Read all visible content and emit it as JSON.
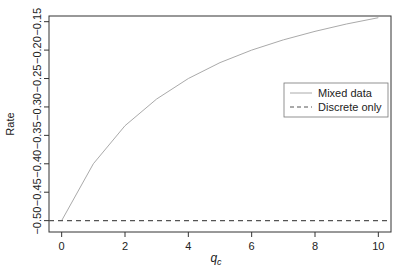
{
  "chart_data": {
    "type": "line",
    "title": "",
    "xlabel": "q_c",
    "xlabel_main": "q",
    "xlabel_sub": "c",
    "ylabel": "Rate",
    "xlim": [
      -0.4,
      10.4
    ],
    "ylim": [
      -0.52,
      -0.14
    ],
    "xticks": [
      0,
      2,
      4,
      6,
      8,
      10
    ],
    "xtick_labels": [
      "0",
      "2",
      "4",
      "6",
      "8",
      "10"
    ],
    "yticks": [
      -0.5,
      -0.45,
      -0.4,
      -0.35,
      -0.3,
      -0.25,
      -0.2,
      -0.15
    ],
    "ytick_labels": [
      "−0.50",
      "−0.45",
      "−0.40",
      "−0.35",
      "−0.30",
      "−0.25",
      "−0.20",
      "−0.15"
    ],
    "grid": false,
    "legend_position": "right-middle",
    "x": [
      0,
      1,
      2,
      3,
      4,
      5,
      6,
      7,
      8,
      9,
      10
    ],
    "series": [
      {
        "name": "Mixed data",
        "style": "solid",
        "color": "#aaaaaa",
        "values": [
          -0.5,
          -0.4,
          -0.333,
          -0.286,
          -0.25,
          -0.222,
          -0.2,
          -0.182,
          -0.167,
          -0.154,
          -0.143
        ]
      },
      {
        "name": "Discrete only",
        "style": "dashed",
        "color": "#555555",
        "values": [
          -0.5,
          -0.5,
          -0.5,
          -0.5,
          -0.5,
          -0.5,
          -0.5,
          -0.5,
          -0.5,
          -0.5,
          -0.5
        ]
      }
    ]
  }
}
